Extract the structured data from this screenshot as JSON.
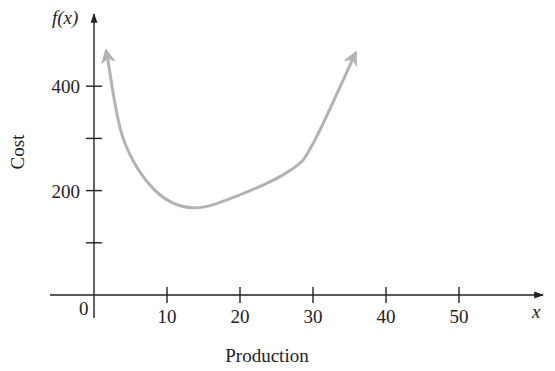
{
  "chart_data": {
    "type": "line",
    "title": "",
    "xlabel": "Production",
    "ylabel": "Cost",
    "x_axis_var": "x",
    "y_axis_var": "f(x)",
    "xlim": [
      0,
      60
    ],
    "ylim": [
      0,
      480
    ],
    "x_ticks": [
      10,
      20,
      30,
      40,
      50
    ],
    "x_tick_labels": [
      "10",
      "20",
      "30",
      "40",
      "50"
    ],
    "y_ticks": [
      100,
      200,
      300,
      400
    ],
    "y_tick_labels": [
      "",
      "200",
      "",
      "400"
    ],
    "origin_label": "0",
    "grid": false,
    "series": [
      {
        "name": "f(x)",
        "color": "#b3b3b3",
        "arrows_both_ends": true,
        "x": [
          1.9,
          4.0,
          8.4,
          13.6,
          20.0,
          27.0,
          30.0,
          35.8
        ],
        "y": [
          450,
          300,
          200,
          167,
          192,
          240,
          290,
          463
        ]
      }
    ]
  },
  "colors": {
    "axis": "#222222",
    "curve": "#b3b3b3"
  }
}
